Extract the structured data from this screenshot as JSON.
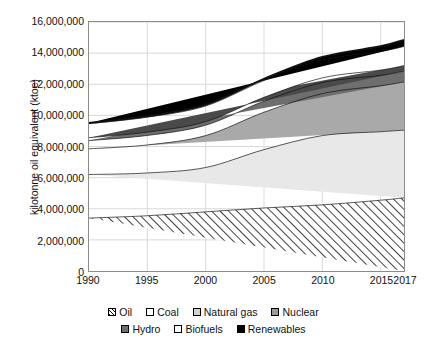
{
  "chart_data": {
    "type": "area",
    "stacked": true,
    "title": "",
    "xlabel": "",
    "ylabel": "kilotonne oil equivalent (ktoe)",
    "x": [
      1990,
      1995,
      2000,
      2005,
      2010,
      2015,
      2017
    ],
    "xlim": [
      1990,
      2017
    ],
    "ylim": [
      0,
      16000000
    ],
    "yticks": [
      0,
      2000000,
      4000000,
      6000000,
      8000000,
      10000000,
      12000000,
      14000000,
      16000000
    ],
    "ytick_labels": [
      "0",
      "2,000,000",
      "4,000,000",
      "6,000,000",
      "8,000,000",
      "10,000,000",
      "12,000,000",
      "14,000,000",
      "16,000,000"
    ],
    "xticks": [
      1990,
      1995,
      2000,
      2005,
      2010,
      2015,
      2017
    ],
    "xtick_labels": [
      "1990",
      "1995",
      "2000",
      "2005",
      "2010",
      "2015",
      "2017"
    ],
    "grid": "horizontal-and-vertical",
    "legend_position": "bottom",
    "series": [
      {
        "name": "Oil",
        "fill": "hatch-diagonal",
        "color": "#ffffff",
        "values": [
          3400000,
          3550000,
          3800000,
          4050000,
          4250000,
          4550000,
          4700000
        ]
      },
      {
        "name": "Coal",
        "fill": "solid",
        "color": "#e8e8e8",
        "values": [
          2800000,
          2750000,
          2850000,
          3750000,
          4450000,
          4400000,
          4350000
        ]
      },
      {
        "name": "Natural gas",
        "fill": "solid",
        "color": "#a9a9a9",
        "values": [
          1650000,
          1800000,
          2050000,
          2400000,
          2700000,
          2950000,
          3100000
        ]
      },
      {
        "name": "Nuclear",
        "fill": "solid",
        "color": "#6e6e6e",
        "values": [
          530000,
          610000,
          670000,
          710000,
          710000,
          670000,
          690000
        ]
      },
      {
        "name": "Hydro",
        "fill": "solid",
        "color": "#4a4a4a",
        "values": [
          185000,
          215000,
          225000,
          250000,
          300000,
          340000,
          360000
        ]
      },
      {
        "name": "Biofuels",
        "fill": "solid",
        "color": "#ffffff",
        "values": [
          900000,
          960000,
          1010000,
          1080000,
          1150000,
          1200000,
          1230000
        ]
      },
      {
        "name": "Renewables",
        "fill": "solid",
        "color": "#000000",
        "values": [
          45000,
          60000,
          75000,
          110000,
          190000,
          330000,
          420000
        ]
      }
    ],
    "totals": [
      8760000,
      9150000,
      9870000,
      11580000,
      13010000,
      13790000,
      13990000
    ]
  },
  "legend": {
    "row1": [
      {
        "label": "Oil",
        "swatch": "sw-oil",
        "icon": "hatched-square-icon"
      },
      {
        "label": "Coal",
        "swatch": "sw-coal",
        "icon": "white-square-icon"
      },
      {
        "label": "Natural gas",
        "swatch": "sw-gas",
        "icon": "light-gray-square-icon"
      },
      {
        "label": "Nuclear",
        "swatch": "sw-nuclear",
        "icon": "gray-square-icon"
      }
    ],
    "row2": [
      {
        "label": "Hydro",
        "swatch": "sw-hydro",
        "icon": "dark-gray-square-icon"
      },
      {
        "label": "Biofuels",
        "swatch": "sw-biofuels",
        "icon": "white-square-icon"
      },
      {
        "label": "Renewables",
        "swatch": "sw-renewables",
        "icon": "black-square-icon"
      }
    ]
  },
  "colors": {
    "oil_hatch_line": "#000000",
    "coal": "#e8e8e8",
    "natural_gas": "#a9a9a9",
    "nuclear": "#6e6e6e",
    "hydro": "#4a4a4a",
    "biofuels": "#ffffff",
    "renewables": "#000000",
    "axis": "#8c8c8c",
    "gridline": "#d9d9d9",
    "text": "#111111"
  }
}
